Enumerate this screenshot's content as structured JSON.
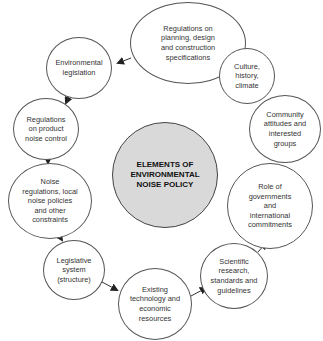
{
  "diagram": {
    "title": "ELEMENTS OF\nENVIRONMENTAL\nNOISE POLICY",
    "nodes": [
      {
        "id": "planning",
        "label": "Regulations on\nplanning, design\nand construction\nspecifications"
      },
      {
        "id": "env-leg",
        "label": "Environmental\nlegislation"
      },
      {
        "id": "culture",
        "label": "Culture,\nhistory,\nclimate"
      },
      {
        "id": "product",
        "label": "Regulations\non product\nnoise control"
      },
      {
        "id": "community",
        "label": "Community\nattitudes and\ninterested\ngroups"
      },
      {
        "id": "noise-regs",
        "label": "Noise\nregulations, local\nnoise policies\nand other\nconstraints"
      },
      {
        "id": "governments",
        "label": "Role of\ngovernments\nand\ninternational\ncommitments"
      },
      {
        "id": "legislative",
        "label": "Legislative\nsystem\n(structure)"
      },
      {
        "id": "scientific",
        "label": "Scientific\nresearch,\nstandards and\nguidelines"
      },
      {
        "id": "technology",
        "label": "Existing\ntechnology and\neconomic\nresources"
      }
    ],
    "flow": [
      "technology",
      "scientific",
      "governments",
      "community",
      "culture",
      "planning",
      "env-leg",
      "product",
      "noise-regs",
      "legislative",
      "technology"
    ],
    "colors": {
      "center_fill": "#d9d9d9",
      "node_fill": "#ffffff",
      "stroke": "#555555",
      "arrow": "#222222"
    }
  }
}
